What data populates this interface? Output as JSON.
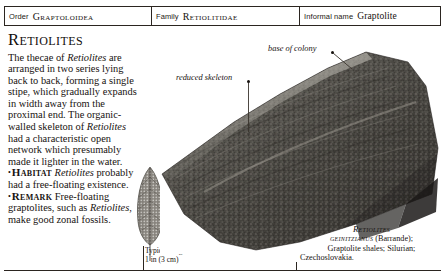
{
  "taxon_bar": {
    "order_key": "Order",
    "order_value": "Graptoloidea",
    "family_key": "Family",
    "family_value": "Retiolitidae",
    "informal_key": "Informal name",
    "informal_value": "Graptolite"
  },
  "entry": {
    "title": "Retiolites",
    "body_line1": "The thecae of ",
    "body_italic1": "Retiolites",
    "body_line2": " are arranged in two series lying back to back, forming a single stipe, which gradually expands in width away from the proximal end. The organic-walled skeleton of ",
    "body_italic2": "Retiolites",
    "body_line3": " had a characteristic open network which presumably made it lighter in the water."
  },
  "bullets": [
    {
      "marker": "•",
      "keyword": "Habitat",
      "text_before": " ",
      "italic": "Retiolites",
      "text_after": " probably had a free-floating existence."
    },
    {
      "marker": "•",
      "keyword": "Remark",
      "text_before": " Free-floating graptolites, such as ",
      "italic": "Retiolites",
      "text_after": ", make good zonal fossils."
    }
  ],
  "scale": {
    "caption_line1": "Typical length",
    "caption_line2": "1 in (3 cm)"
  },
  "annotations": [
    {
      "label": "base of colony"
    },
    {
      "label": "reduced skeleton"
    }
  ],
  "photo_caption": {
    "genus": "Retiolites",
    "species": "geinitzianus",
    "authority": " (Barrande);",
    "line3": "Graptolite shales; Silurian;",
    "line4": "Czechoslovakia."
  },
  "colors": {
    "rule": "#2b2520",
    "text": "#17120f",
    "rock_dark": "#3c3a37",
    "rock_mid": "#6b6862",
    "rock_light": "#9a968e"
  }
}
